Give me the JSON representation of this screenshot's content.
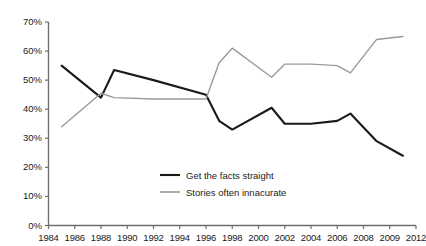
{
  "chart_data": {
    "type": "line",
    "title": "",
    "subtitle": "",
    "xlabel": "",
    "ylabel": "",
    "xlim": [
      1984,
      2012
    ],
    "ylim": [
      0,
      70
    ],
    "ytick_labels": [
      "0%",
      "10%",
      "20%",
      "30%",
      "40%",
      "50%",
      "60%",
      "70%"
    ],
    "ytick_values": [
      0,
      10,
      20,
      30,
      40,
      50,
      60,
      70
    ],
    "categories": [
      "1984",
      "1986",
      "1988",
      "1990",
      "1992",
      "1994",
      "1996",
      "1998",
      "2000",
      "2002",
      "2004",
      "2006",
      "2008",
      "2009",
      "2012"
    ],
    "x": [
      1985,
      1988,
      1989,
      1992,
      1998,
      2001,
      2002,
      2003,
      2005,
      2007,
      2009,
      2011
    ],
    "grid": false,
    "legend_position": "center-bottom-inside",
    "series": [
      {
        "name": "Get the facts straight",
        "color": "#1a1a1a",
        "points": [
          {
            "x": 1985,
            "y": 55
          },
          {
            "x": 1988,
            "y": 44
          },
          {
            "x": 1989,
            "y": 53.5
          },
          {
            "x": 1992,
            "y": 50
          },
          {
            "x": 1996,
            "y": 45
          },
          {
            "x": 1997,
            "y": 36
          },
          {
            "x": 1998,
            "y": 33
          },
          {
            "x": 2001,
            "y": 40.5
          },
          {
            "x": 2002,
            "y": 35
          },
          {
            "x": 2004,
            "y": 35
          },
          {
            "x": 2006,
            "y": 36
          },
          {
            "x": 2007,
            "y": 38.5
          },
          {
            "x": 2009,
            "y": 29
          },
          {
            "x": 2011,
            "y": 24
          }
        ]
      },
      {
        "name": "Stories often innacurate",
        "color": "#9a9a9a",
        "points": [
          {
            "x": 1985,
            "y": 34
          },
          {
            "x": 1988,
            "y": 45.5
          },
          {
            "x": 1989,
            "y": 44
          },
          {
            "x": 1992,
            "y": 43.5
          },
          {
            "x": 1996,
            "y": 43.5
          },
          {
            "x": 1997,
            "y": 56
          },
          {
            "x": 1998,
            "y": 61
          },
          {
            "x": 2001,
            "y": 51
          },
          {
            "x": 2002,
            "y": 55.5
          },
          {
            "x": 2004,
            "y": 55.5
          },
          {
            "x": 2006,
            "y": 55
          },
          {
            "x": 2007,
            "y": 52.5
          },
          {
            "x": 2009,
            "y": 64
          },
          {
            "x": 2011,
            "y": 65
          }
        ]
      }
    ]
  },
  "legend": {
    "items": [
      {
        "label": "Get the facts straight",
        "color": "#1a1a1a"
      },
      {
        "label": "Stories often innacurate",
        "color": "#9a9a9a"
      }
    ]
  }
}
